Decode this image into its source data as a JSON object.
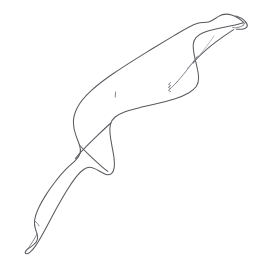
{
  "image": {
    "title": "Seal line drawing",
    "subject": "seal",
    "style": "black and white contour line drawing",
    "orientation": "diagonal, head upper-right, tail lower-left",
    "width": 254,
    "height": 274,
    "background_color": "#ffffff",
    "stroke_color": "#5a5a60",
    "detail_stroke_color": "#6e6e76",
    "faint_stroke_color": "#9a9aa2",
    "stroke_width": 1.05,
    "has_text": false,
    "has_color_fill": false
  },
  "parts": {
    "body_outline": {
      "name": "body-outline",
      "description": "continuous contour of the seal: head, back, tail and belly",
      "path": "M 244.2 23.0 C 241.0 19.6 236.4 16.3 231.6 14.9 C 226.8 13.5 222.0 14.3 218.6 16.4 C 215.0 18.6 212.0 21.2 208.6 22.0 C 205.0 22.8 201.0 22.1 197.0 23.4 C 190.0 25.7 182.4 30.6 174.0 35.6 C 165.0 41.0 155.4 46.8 146.0 52.6 C 134.0 60.0 122.6 67.2 112.6 74.0 C 104.0 79.9 96.6 85.6 90.4 91.4 C 84.8 96.6 80.4 101.9 77.4 107.4 C 74.8 112.2 73.4 117.2 73.4 122.4 C 73.4 127.0 74.5 131.4 76.0 135.6 C 77.2 139.0 78.6 142.2 79.6 145.4 C 80.4 148.0 80.8 150.6 80.2 153.0 C 79.5 155.8 77.6 158.2 75.2 160.6 C 72.4 163.4 69.0 166.2 65.8 169.4 C 62.2 173.0 58.8 177.0 55.6 181.2 C 52.0 185.8 48.6 190.6 45.6 195.4 C 42.6 200.2 40.0 204.9 38.0 209.2 C 36.2 213.2 35.0 216.9 34.6 220.2 C 34.2 223.4 34.6 226.2 35.4 228.8 C 36.1 231.1 37.0 233.3 37.4 235.6 C 37.8 237.8 37.6 239.9 36.4 241.8 C 35.2 243.7 33.2 245.2 31.2 246.6 C 29.4 247.9 27.6 249.0 26.4 250.2 C 25.6 251.0 25.1 251.8 25.2 252.6 C 25.3 253.4 26.0 253.9 26.9 253.8 C 28.0 253.7 29.2 252.9 30.4 251.9 C 32.0 250.5 33.6 248.6 35.2 246.4 C 37.2 243.6 39.2 240.3 41.2 236.8 C 43.6 232.6 46.0 228.1 48.4 223.6 C 51.2 218.3 54.0 212.9 56.8 207.8 C 60.0 201.9 63.2 196.3 66.2 191.4 C 69.6 185.9 72.8 181.2 75.6 177.6 C 78.7 173.6 81.5 170.8 84.0 169.2 C 86.6 167.5 89.0 167.0 91.4 167.5 C 94.0 168.0 96.6 169.5 99.2 171.0 C 101.6 172.4 104.0 173.8 106.2 174.4 C 108.2 174.9 110.0 174.7 111.4 173.6 C 112.9 172.4 113.8 170.4 114.2 167.8 C 114.6 165.0 114.5 161.6 114.0 157.8 C 113.5 153.8 112.6 149.5 111.8 145.2 C 111.0 141.0 110.3 136.9 110.0 133.2 C 109.7 129.6 109.8 126.4 110.6 123.8 C 111.4 121.0 113.0 118.8 115.2 117.0 C 117.6 115.0 120.8 113.4 124.4 112.0 C 128.6 110.4 133.4 109.1 138.4 107.9 C 144.2 106.5 150.4 105.2 156.4 103.8 C 162.8 102.3 169.0 100.7 174.4 99.0 C 180.0 97.2 184.8 95.2 188.6 93.0 C 192.2 90.9 194.8 88.6 196.4 86.2 C 198.0 83.7 198.6 81.0 198.6 78.0 C 198.6 74.6 197.9 70.9 197.0 67.0 C 196.1 63.0 195.0 58.8 194.2 54.8 C 193.5 51.2 193.0 47.8 193.2 44.8 C 193.4 42.0 194.3 39.6 196.0 37.6 C 197.8 35.5 200.4 33.9 203.6 32.6 C 207.2 31.1 211.4 30.0 215.8 29.0 C 220.6 27.9 225.6 27.0 230.2 26.0 C 234.6 25.1 238.6 24.1 241.6 23.2 C 242.6 22.9 243.5 22.6 244.2 23.0 Z"
    },
    "head_crown": {
      "name": "head-crown",
      "description": "top curve of the head with slight peak"
    },
    "snout": {
      "name": "snout",
      "description": "pointed snout at the far right with nose tip",
      "path": "M 236.0 16.0 C 239.6 17.0 243.0 19.0 245.2 21.4 C 246.8 23.2 247.6 25.0 247.2 26.4 C 246.8 27.8 245.2 28.6 243.2 29.0 C 241.2 29.4 238.8 29.4 236.4 29.2"
    },
    "mouth_line": {
      "name": "mouth-line",
      "description": "short mouth line under the nose",
      "path": "M 243.4 25.4 C 241.6 26.4 239.4 27.2 237.2 27.6 C 235.4 27.9 233.8 27.9 232.6 27.4"
    },
    "nostril_mark": {
      "name": "nostril-mark",
      "description": "tiny nostril tick at the snout tip",
      "path": "M 245.6 22.6 C 244.8 23.4 244.0 24.2 243.4 25.0"
    },
    "jaw_line": {
      "name": "jaw-line",
      "description": "underside jaw curve from chin back into the neck",
      "path": "M 233.6 29.6 C 228.0 33.2 221.6 37.6 215.6 42.2 C 210.0 46.5 204.8 50.9 200.6 54.8 C 197.2 58.0 194.6 60.8 193.2 63.0"
    },
    "neck_fold": {
      "name": "neck-fold",
      "description": "faint fold line along the neck and shoulder",
      "path": "M 214.0 36.0 C 209.2 43.0 203.6 50.4 198.4 56.6 C 194.0 61.8 190.0 66.0 187.2 68.4"
    },
    "front_flipper": {
      "name": "front-flipper",
      "description": "front flipper with claws, angled down-left from the shoulder",
      "path": "M 197.6 56.0 C 194.0 60.8 190.0 66.2 186.2 71.0 C 182.6 75.5 179.0 79.8 176.0 83.0 C 173.6 85.6 171.6 87.4 170.4 88.4"
    },
    "flipper_claws": {
      "name": "flipper-claws",
      "description": "small zigzag claw detail at the tip of the front flipper",
      "path": "M 170.6 82.4 L 168.6 84.4 L 170.6 85.6 L 168.4 87.4 L 170.4 88.6 L 168.4 90.4 L 170.6 91.6"
    },
    "belly_notch": {
      "name": "belly-notch",
      "description": "small notch where the belly meets the flank",
      "path": "M 115.6 92.0 L 115.2 97.0"
    },
    "hind_flipper_upper": {
      "name": "hind-flipper-upper",
      "description": "upper hind flipper crossing the body axis",
      "path": "M 110.8 123.0 C 106.0 127.4 100.4 132.6 95.2 137.6 C 90.2 142.4 85.6 147.0 82.0 150.8 C 79.0 154.0 76.8 156.6 75.6 158.4"
    },
    "hind_flipper_lower": {
      "name": "hind-flipper-lower",
      "description": "lower hind flipper crossing beneath the upper one",
      "path": "M 79.4 145.0 C 82.6 148.6 86.6 152.6 90.6 156.4 C 94.6 160.2 98.6 163.8 101.8 166.6 C 104.4 168.8 106.4 170.4 107.8 171.4"
    },
    "tail_tip": {
      "name": "tail-tip",
      "description": "narrow tail tip at the lower-left of the frame",
      "path": "M 37.0 234.0 C 35.0 238.0 32.4 242.2 30.0 245.6 C 28.0 248.4 26.4 250.6 25.4 252.0"
    },
    "tail_notch": {
      "name": "tail-notch",
      "description": "small concave notch along the rear tail edge",
      "path": "M 35.0 221.0 C 36.6 222.6 38.2 224.2 39.0 225.8"
    }
  }
}
